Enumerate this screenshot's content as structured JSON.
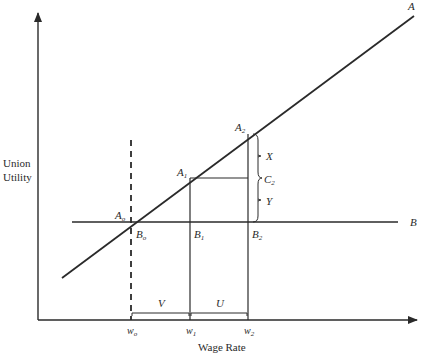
{
  "diagram": {
    "axes": {
      "y_label_line1": "Union",
      "y_label_line2": "Utility",
      "x_label": "Wage Rate"
    },
    "lines": {
      "A": {
        "label": "A"
      },
      "B": {
        "label": "B"
      }
    },
    "points": {
      "A0": {
        "base": "A",
        "sub": "o"
      },
      "A1": {
        "base": "A",
        "sub": "1"
      },
      "A2": {
        "base": "A",
        "sub": "2"
      },
      "B0": {
        "base": "B",
        "sub": "o"
      },
      "B1": {
        "base": "B",
        "sub": "1"
      },
      "B2": {
        "base": "B",
        "sub": "2"
      }
    },
    "x_ticks": {
      "w0": {
        "base": "w",
        "sub": "o"
      },
      "w1": {
        "base": "w",
        "sub": "1"
      },
      "w2": {
        "base": "w",
        "sub": "2"
      }
    },
    "segments": {
      "X": "X",
      "Y": "Y",
      "C2": {
        "base": "C",
        "sub": "2"
      },
      "V": "V",
      "U": "U"
    },
    "colors": {
      "ink": "#2a2a2a",
      "background": "#ffffff"
    }
  }
}
